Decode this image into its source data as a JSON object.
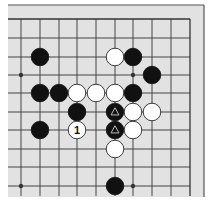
{
  "diagram": {
    "type": "go-board-fragment",
    "colors": {
      "board": "#e2e2e2",
      "frame": "#555555",
      "grid": "#333333",
      "black_stone": "#111111",
      "white_stone": "#ffffff",
      "triangle_mark": "#bbbbbb"
    },
    "grid": {
      "columns_x": [
        21,
        40,
        59,
        77,
        96,
        115,
        133,
        152,
        171,
        190
      ],
      "rows_y": [
        19,
        38,
        57,
        75,
        93,
        112,
        130,
        149,
        167,
        186
      ]
    },
    "star_points": [
      {
        "col": 0,
        "row": 3
      },
      {
        "col": 6,
        "row": 3
      },
      {
        "col": 0,
        "row": 9
      },
      {
        "col": 6,
        "row": 9
      }
    ],
    "stones": [
      {
        "col": 1,
        "row": 2,
        "color": "black"
      },
      {
        "col": 5,
        "row": 2,
        "color": "white"
      },
      {
        "col": 6,
        "row": 2,
        "color": "black"
      },
      {
        "col": 7,
        "row": 3,
        "color": "black"
      },
      {
        "col": 1,
        "row": 4,
        "color": "black"
      },
      {
        "col": 2,
        "row": 4,
        "color": "black"
      },
      {
        "col": 3,
        "row": 4,
        "color": "white"
      },
      {
        "col": 4,
        "row": 4,
        "color": "white"
      },
      {
        "col": 5,
        "row": 4,
        "color": "white"
      },
      {
        "col": 6,
        "row": 4,
        "color": "black"
      },
      {
        "col": 3,
        "row": 5,
        "color": "black"
      },
      {
        "col": 5,
        "row": 5,
        "color": "black",
        "mark": "triangle"
      },
      {
        "col": 6,
        "row": 5,
        "color": "white"
      },
      {
        "col": 7,
        "row": 5,
        "color": "white"
      },
      {
        "col": 1,
        "row": 6,
        "color": "black"
      },
      {
        "col": 3,
        "row": 6,
        "color": "white",
        "label": "1"
      },
      {
        "col": 5,
        "row": 6,
        "color": "black",
        "mark": "triangle"
      },
      {
        "col": 6,
        "row": 6,
        "color": "white"
      },
      {
        "col": 5,
        "row": 7,
        "color": "white"
      },
      {
        "col": 5,
        "row": 9,
        "color": "black"
      }
    ]
  }
}
